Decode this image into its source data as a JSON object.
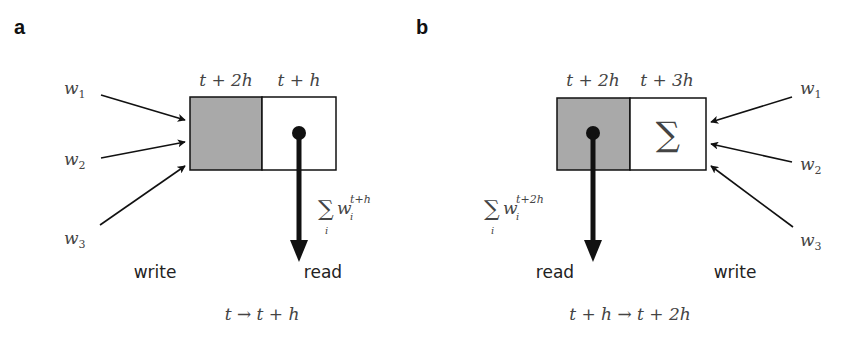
{
  "colors": {
    "background": "#ffffff",
    "stroke": "#111111",
    "shaded_cell": "#a9a9a9",
    "text_math": "#444444"
  },
  "panels": [
    {
      "id": "a",
      "label": "a",
      "cells": [
        {
          "header": "t + 2h",
          "shaded": true,
          "content": ""
        },
        {
          "header": "t + h",
          "shaded": false,
          "content": "read-pointer"
        }
      ],
      "inputs": [
        {
          "label": "w",
          "sub": "1"
        },
        {
          "label": "w",
          "sub": "2"
        },
        {
          "label": "w",
          "sub": "3"
        }
      ],
      "read_expr": {
        "sum": "∑",
        "index": "i",
        "var": "w",
        "sub": "i",
        "sup": "t+h"
      },
      "write_label": "write",
      "read_label": "read",
      "transition": "t → t + h"
    },
    {
      "id": "b",
      "label": "b",
      "cells": [
        {
          "header": "t + 2h",
          "shaded": true,
          "content": "read-pointer"
        },
        {
          "header": "t + 3h",
          "shaded": false,
          "content": "∑"
        }
      ],
      "inputs": [
        {
          "label": "w",
          "sub": "1"
        },
        {
          "label": "w",
          "sub": "2"
        },
        {
          "label": "w",
          "sub": "3"
        }
      ],
      "read_expr": {
        "sum": "∑",
        "index": "i",
        "var": "w",
        "sub": "i",
        "sup": "t+2h"
      },
      "write_label": "write",
      "read_label": "read",
      "transition": "t + h → t + 2h"
    }
  ]
}
